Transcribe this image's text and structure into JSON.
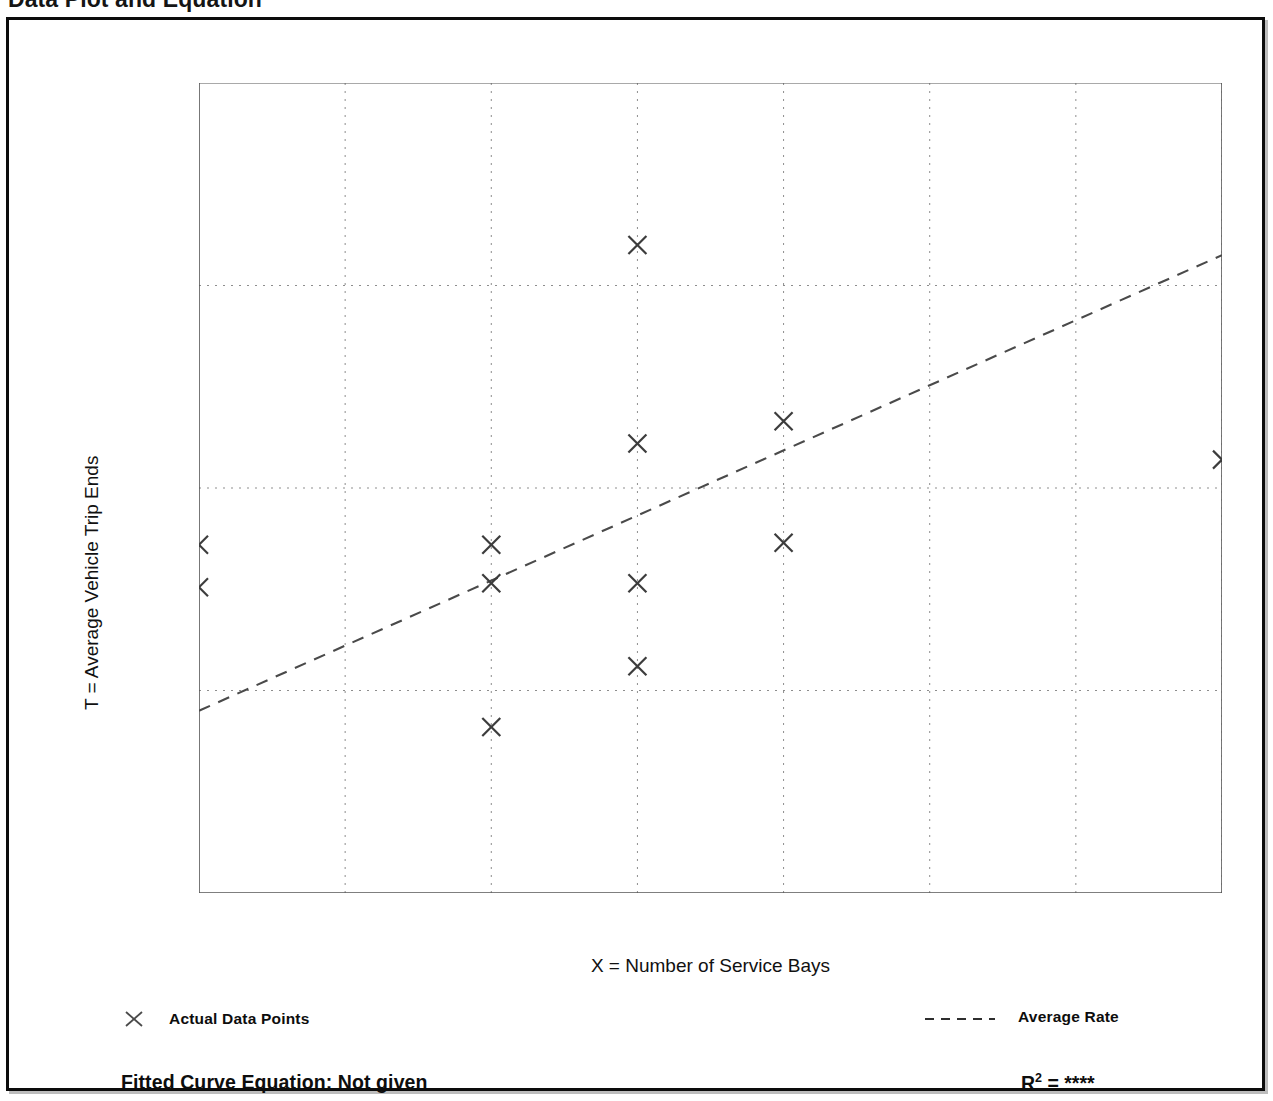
{
  "page": {
    "title": "Data Plot and Equation"
  },
  "chart_data": {
    "type": "scatter",
    "title": "Data Plot and Equation",
    "xlabel": "X = Number of Service Bays",
    "ylabel": "T = Average Vehicle Trip Ends",
    "xlim": [
      6,
      13
    ],
    "ylim": [
      10,
      50
    ],
    "x_ticks": [
      6,
      7,
      8,
      9,
      10,
      11,
      12,
      13
    ],
    "x_tick_labels": [
      "6",
      "7",
      "8",
      "9",
      "10",
      "11",
      "12",
      "13"
    ],
    "y_ticks": [
      10,
      20,
      30,
      40,
      50
    ],
    "y_tick_labels": [
      "10",
      "20",
      "30",
      "40",
      "50"
    ],
    "y_minor_ticks": [
      15,
      25,
      35,
      45
    ],
    "grid": true,
    "grid_style": "dotted",
    "legend_position": "below-axes",
    "series": [
      {
        "name": "Actual Data Points",
        "type": "scatter",
        "marker": "x",
        "color": "#3c3c3c",
        "points": [
          {
            "x": 6,
            "y": 27.2
          },
          {
            "x": 6,
            "y": 25.1
          },
          {
            "x": 8,
            "y": 27.2
          },
          {
            "x": 8,
            "y": 25.3
          },
          {
            "x": 8,
            "y": 18.2
          },
          {
            "x": 9,
            "y": 42.0
          },
          {
            "x": 9,
            "y": 32.2
          },
          {
            "x": 9,
            "y": 25.3
          },
          {
            "x": 9,
            "y": 21.2
          },
          {
            "x": 10,
            "y": 33.3
          },
          {
            "x": 10,
            "y": 27.3
          },
          {
            "x": 13,
            "y": 31.4
          }
        ]
      },
      {
        "name": "Average Rate",
        "type": "line",
        "style": "dashed",
        "color": "#4a4a4a",
        "endpoints": [
          {
            "x": 6,
            "y": 19.0
          },
          {
            "x": 13,
            "y": 41.5
          }
        ]
      }
    ]
  },
  "legend": {
    "data_points_label": "Actual Data Points",
    "average_rate_label": "Average Rate",
    "marker_icon": "x-marker-icon",
    "line_icon": "dashed-line-icon"
  },
  "annotations": {
    "equation_label": "Fitted Curve Equation:  Not given",
    "r2_symbol": "R",
    "r2_exponent": "2",
    "r2_equals": " = ",
    "r2_value": "****"
  }
}
